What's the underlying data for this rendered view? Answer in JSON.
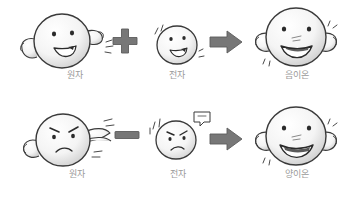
{
  "diagram": {
    "background_color": "#ffffff",
    "label_color": "#9a9a9a",
    "operator_color": "#6e6e6e",
    "outline_color": "#3a3a3a",
    "face_fill_color": "#f2f2f2",
    "face_shadow_color": "#d8d8d8",
    "rows": [
      {
        "id": "anion-formation",
        "operator_1": {
          "name": "plus-sign",
          "symbol": "+"
        },
        "operator_2": {
          "name": "arrow-right",
          "symbol": "➡"
        },
        "terms": [
          {
            "id": "atom-neutral",
            "label": "원자",
            "mood": "happy",
            "size": "large"
          },
          {
            "id": "electron-incoming",
            "label": "전자",
            "mood": "happy",
            "size": "small"
          },
          {
            "id": "anion",
            "label": "음이온",
            "mood": "very-happy",
            "size": "xlarge"
          }
        ]
      },
      {
        "id": "cation-formation",
        "operator_1": {
          "name": "minus-sign",
          "symbol": "−"
        },
        "operator_2": {
          "name": "arrow-right",
          "symbol": "➡"
        },
        "terms": [
          {
            "id": "atom-neutral-2",
            "label": "원자",
            "mood": "angry",
            "size": "large"
          },
          {
            "id": "electron-leaving",
            "label": "전자",
            "mood": "angry",
            "size": "small"
          },
          {
            "id": "cation",
            "label": "양이온",
            "mood": "very-happy",
            "size": "xlarge"
          }
        ]
      }
    ]
  }
}
